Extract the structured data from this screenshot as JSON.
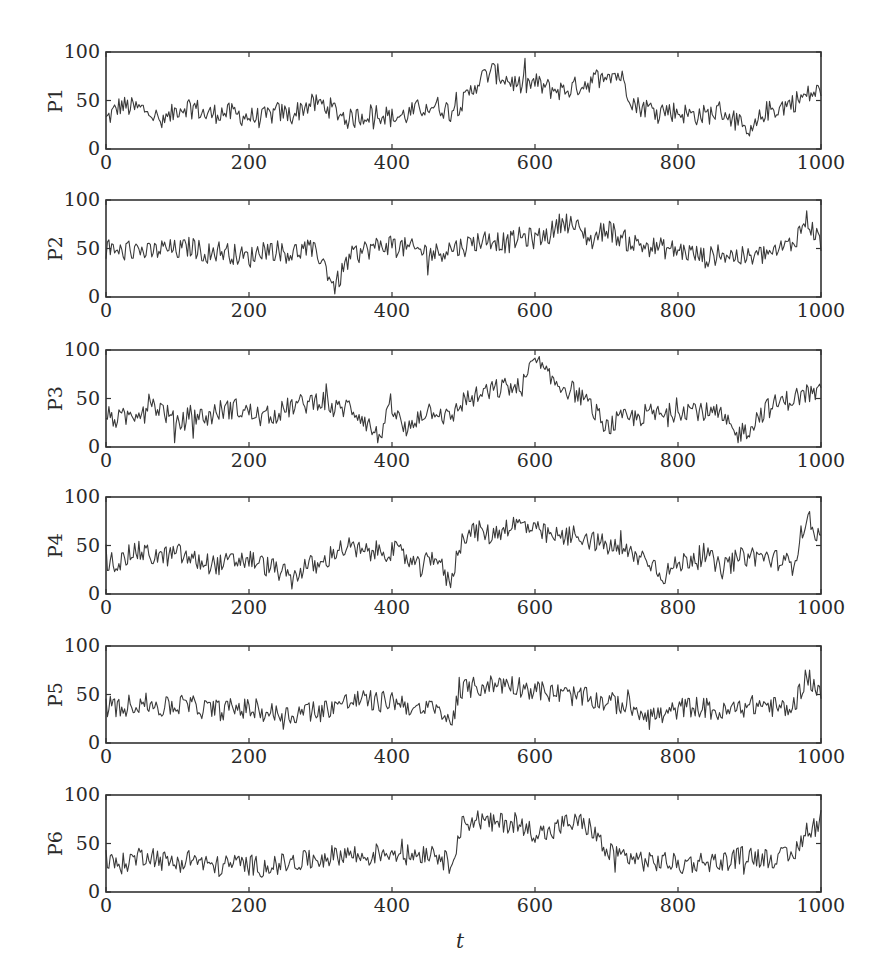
{
  "chart_data": [
    {
      "type": "line",
      "ylabel": "P1",
      "xlim": [
        0,
        1000
      ],
      "ylim": [
        0,
        100
      ],
      "xticks": [
        "0",
        "200",
        "400",
        "600",
        "800",
        "1000"
      ],
      "yticks": [
        "0",
        "50",
        "100"
      ],
      "sample_step": 20,
      "values": [
        30,
        45,
        42,
        40,
        25,
        42,
        45,
        35,
        38,
        36,
        33,
        32,
        38,
        35,
        45,
        47,
        40,
        30,
        35,
        38,
        32,
        35,
        42,
        45,
        40,
        48,
        70,
        80,
        72,
        65,
        68,
        62,
        60,
        65,
        70,
        80,
        75,
        45,
        42,
        40,
        38,
        35,
        35,
        40,
        30,
        12,
        38,
        42,
        48,
        55,
        60
      ]
    },
    {
      "type": "line",
      "ylabel": "P2",
      "xlim": [
        0,
        1000
      ],
      "ylim": [
        0,
        100
      ],
      "xticks": [
        "0",
        "200",
        "400",
        "600",
        "800",
        "1000"
      ],
      "yticks": [
        "0",
        "50",
        "100"
      ],
      "sample_step": 20,
      "values": [
        48,
        46,
        50,
        45,
        50,
        48,
        52,
        45,
        48,
        44,
        40,
        50,
        48,
        45,
        50,
        42,
        10,
        40,
        48,
        52,
        55,
        50,
        48,
        45,
        50,
        52,
        58,
        60,
        55,
        62,
        60,
        65,
        80,
        70,
        58,
        72,
        60,
        55,
        52,
        50,
        48,
        45,
        40,
        45,
        42,
        40,
        44,
        48,
        55,
        80,
        55
      ]
    },
    {
      "type": "line",
      "ylabel": "P3",
      "xlim": [
        0,
        1000
      ],
      "ylim": [
        0,
        100
      ],
      "xticks": [
        "0",
        "200",
        "400",
        "600",
        "800",
        "1000"
      ],
      "yticks": [
        "0",
        "50",
        "100"
      ],
      "sample_step": 20,
      "values": [
        32,
        28,
        35,
        45,
        38,
        22,
        34,
        30,
        38,
        40,
        36,
        30,
        35,
        42,
        45,
        50,
        38,
        42,
        30,
        10,
        40,
        15,
        35,
        40,
        28,
        48,
        52,
        58,
        62,
        60,
        90,
        70,
        62,
        55,
        40,
        20,
        28,
        30,
        35,
        32,
        38,
        40,
        35,
        32,
        12,
        20,
        38,
        45,
        50,
        55,
        55
      ]
    },
    {
      "type": "line",
      "ylabel": "P4",
      "xlim": [
        0,
        1000
      ],
      "ylim": [
        0,
        100
      ],
      "xticks": [
        "0",
        "200",
        "400",
        "600",
        "800",
        "1000"
      ],
      "yticks": [
        "0",
        "50",
        "100"
      ],
      "sample_step": 20,
      "values": [
        35,
        32,
        45,
        40,
        38,
        42,
        35,
        32,
        30,
        34,
        36,
        30,
        25,
        15,
        30,
        28,
        45,
        48,
        42,
        44,
        45,
        38,
        25,
        42,
        10,
        62,
        65,
        60,
        70,
        72,
        65,
        60,
        58,
        62,
        55,
        50,
        45,
        40,
        35,
        20,
        30,
        38,
        40,
        25,
        35,
        40,
        38,
        35,
        30,
        80,
        55
      ]
    },
    {
      "type": "line",
      "ylabel": "P5",
      "xlim": [
        0,
        1000
      ],
      "ylim": [
        0,
        100
      ],
      "xticks": [
        "0",
        "200",
        "400",
        "600",
        "800",
        "1000"
      ],
      "yticks": [
        "0",
        "50",
        "100"
      ],
      "sample_step": 20,
      "values": [
        38,
        35,
        42,
        40,
        36,
        40,
        38,
        35,
        34,
        36,
        35,
        32,
        30,
        28,
        35,
        32,
        40,
        42,
        45,
        42,
        44,
        40,
        30,
        40,
        20,
        55,
        58,
        60,
        62,
        58,
        55,
        52,
        50,
        48,
        45,
        42,
        40,
        36,
        30,
        28,
        35,
        38,
        36,
        30,
        35,
        38,
        40,
        36,
        35,
        70,
        50
      ]
    },
    {
      "type": "line",
      "ylabel": "P6",
      "xlim": [
        0,
        1000
      ],
      "ylim": [
        0,
        100
      ],
      "xticks": [
        "0",
        "200",
        "400",
        "600",
        "800",
        "1000"
      ],
      "yticks": [
        "0",
        "50",
        "100"
      ],
      "sample_step": 20,
      "values": [
        30,
        28,
        35,
        40,
        32,
        30,
        35,
        28,
        26,
        30,
        28,
        26,
        28,
        30,
        32,
        35,
        38,
        40,
        35,
        40,
        42,
        38,
        40,
        42,
        28,
        72,
        75,
        70,
        72,
        68,
        62,
        60,
        70,
        72,
        65,
        40,
        38,
        35,
        30,
        32,
        28,
        30,
        32,
        30,
        35,
        38,
        35,
        36,
        35,
        65,
        70
      ]
    }
  ],
  "xlabel": "t"
}
